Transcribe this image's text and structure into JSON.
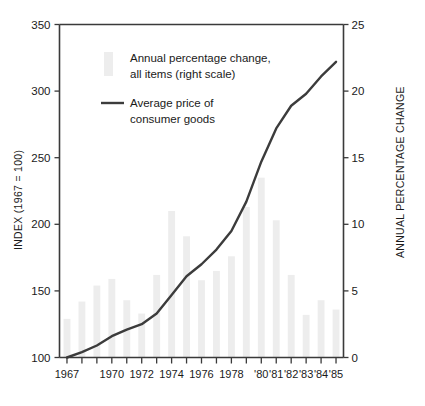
{
  "chart_data": {
    "type": "bar",
    "title": "",
    "subtitle": "",
    "xlabel": "",
    "ylabel": "INDEX (1967 = 100)",
    "y2label": "ANNUAL PERCENTAGE CHANGE",
    "grid": false,
    "legend_position": "top-left-inside",
    "x": [
      1967,
      1968,
      1969,
      1970,
      1971,
      1972,
      1973,
      1974,
      1975,
      1976,
      1977,
      1978,
      1979,
      1980,
      1981,
      1982,
      1983,
      1984,
      1985
    ],
    "categories": [
      "1967",
      "1968",
      "1969",
      "1970",
      "1971",
      "1972",
      "1973",
      "1974",
      "1975",
      "1976",
      "1977",
      "1978",
      "1979",
      "1980",
      "1981",
      "1982",
      "1983",
      "1984",
      "1985"
    ],
    "xtick_labels": [
      "1967",
      "",
      "",
      "1970",
      "",
      "1972",
      "",
      "1974",
      "",
      "1976",
      "",
      "1978",
      "",
      "'80",
      "'81",
      "'82",
      "'83",
      "'84",
      "'85"
    ],
    "xtick_labels_visible": [
      "1967",
      "1970",
      "1972",
      "1974",
      "1976",
      "1978",
      "'80",
      "'81",
      "'82",
      "'83",
      "'84",
      "'85"
    ],
    "ylim": [
      100,
      350
    ],
    "yticks": [
      100,
      150,
      200,
      250,
      300,
      350
    ],
    "ytick_labels": [
      "100",
      "150",
      "200",
      "250",
      "300",
      "350"
    ],
    "y2lim": [
      0,
      25
    ],
    "y2ticks": [
      0,
      5,
      10,
      15,
      20,
      25
    ],
    "y2tick_labels": [
      "0",
      "5",
      "10",
      "15",
      "20",
      "25"
    ],
    "series": [
      {
        "name": "Annual percentage change, all items (right scale)",
        "type": "bar",
        "axis": "right",
        "color": "#ededed",
        "values": [
          2.9,
          4.2,
          5.4,
          5.9,
          4.3,
          3.3,
          6.2,
          11.0,
          9.1,
          5.8,
          6.5,
          7.6,
          11.3,
          13.5,
          10.3,
          6.2,
          3.2,
          4.3,
          3.6
        ]
      },
      {
        "name": "Average price of consumer goods",
        "type": "line",
        "axis": "left",
        "color": "#3c3c3c",
        "values": [
          100,
          104,
          109,
          116,
          121,
          125,
          133,
          147,
          161,
          170,
          181,
          195,
          217,
          247,
          272,
          289,
          298,
          311,
          322
        ]
      }
    ],
    "legend": [
      {
        "label_line1": "Annual percentage change,",
        "label_line2": "all items (right scale)",
        "marker": "bar-swatch",
        "color": "#ededed"
      },
      {
        "label_line1": "Average price of",
        "label_line2": "consumer goods",
        "marker": "line-rule",
        "color": "#3c3c3c"
      }
    ],
    "colors": {
      "bar": "#ededed",
      "line": "#3c3c3c",
      "axis": "#3a3a3a",
      "text": "#1a1a1a",
      "background": "#ffffff"
    }
  }
}
